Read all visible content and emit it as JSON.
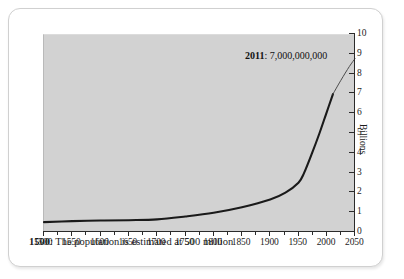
{
  "chart_data": {
    "type": "line",
    "title": "",
    "subtitle": "",
    "xlabel": "",
    "ylabel": "Billions",
    "xlim": [
      1500,
      2050
    ],
    "ylim": [
      0,
      10
    ],
    "grid": false,
    "legend": false,
    "x_ticks": [
      1500,
      1550,
      1600,
      1650,
      1700,
      1750,
      1800,
      1850,
      1900,
      1950,
      2000,
      2050
    ],
    "x_tick_labels": [
      "1500",
      "1550",
      "1600",
      "1650",
      "1700",
      "1750",
      "1800",
      "1850",
      "1900",
      "1950",
      "2000",
      "2050"
    ],
    "x_minor_ticks": [
      1525,
      1575,
      1625,
      1675,
      1725,
      1775,
      1825,
      1875,
      1925,
      1975,
      2025
    ],
    "y_ticks": [
      0,
      1,
      2,
      3,
      4,
      5,
      6,
      7,
      8,
      9,
      10
    ],
    "y_tick_labels": [
      "0",
      "1",
      "2",
      "3",
      "4",
      "5",
      "6",
      "7",
      "8",
      "9",
      "10"
    ],
    "series": [
      {
        "name": "World population",
        "unit": "billions",
        "x": [
          1500,
          1550,
          1600,
          1650,
          1700,
          1750,
          1800,
          1850,
          1900,
          1927,
          1950,
          1960,
          1974,
          1987,
          1999,
          2011
        ],
        "values": [
          0.5,
          0.55,
          0.58,
          0.6,
          0.64,
          0.79,
          0.98,
          1.26,
          1.65,
          2.0,
          2.5,
          3.0,
          4.0,
          5.0,
          6.0,
          7.0
        ]
      },
      {
        "name": "Projection",
        "unit": "billions",
        "x": [
          2011,
          2025,
          2040,
          2050
        ],
        "values": [
          7.0,
          7.7,
          8.4,
          8.8
        ]
      }
    ],
    "annotations": [
      {
        "year": "2011",
        "separator": ": ",
        "value": "7,000,000,000"
      }
    ],
    "caption": {
      "year": "1500",
      "separator": ": ",
      "text": "The population is estimated at 500 million"
    },
    "colors": {
      "plot_background": "#d2d2d2",
      "card_background": "#ffffff",
      "axis": "#2b2b2b",
      "line": "#1a1a1a",
      "projection_line": "#4a4a4a",
      "text": "#1c1c1c"
    }
  }
}
